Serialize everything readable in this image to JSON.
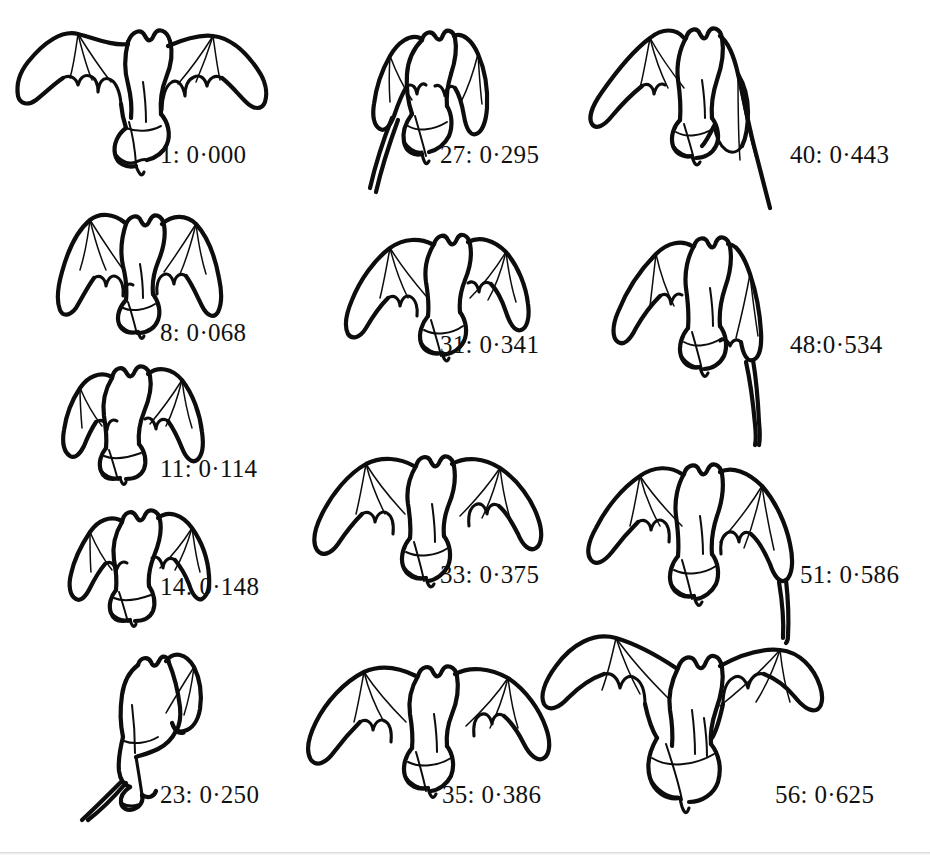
{
  "figure": {
    "kind": "scientific-line-drawing-sequence",
    "background_color": "#ffffff",
    "ink_color": "#0d0d0d",
    "text_color": "#111111",
    "decimal_separator": "·",
    "label_format": "frame: time",
    "columns": 3,
    "frame_count": 13
  },
  "columns": [
    {
      "name": "column-left",
      "frames": [
        {
          "id": "frame-1",
          "label": "1: 0·000",
          "frame_number": "1",
          "time_value": "0·000"
        },
        {
          "id": "frame-8",
          "label": "8: 0·068",
          "frame_number": "8",
          "time_value": "0·068"
        },
        {
          "id": "frame-11",
          "label": "11: 0·114",
          "frame_number": "11",
          "time_value": "0·114"
        },
        {
          "id": "frame-14",
          "label": "14: 0·148",
          "frame_number": "14",
          "time_value": "0·148"
        },
        {
          "id": "frame-23",
          "label": "23: 0·250",
          "frame_number": "23",
          "time_value": "0·250"
        }
      ]
    },
    {
      "name": "column-middle",
      "frames": [
        {
          "id": "frame-27",
          "label": "27: 0·295",
          "frame_number": "27",
          "time_value": "0·295"
        },
        {
          "id": "frame-31",
          "label": "31: 0·341",
          "frame_number": "31",
          "time_value": "0·341"
        },
        {
          "id": "frame-33",
          "label": "33: 0·375",
          "frame_number": "33",
          "time_value": "0·375"
        },
        {
          "id": "frame-35",
          "label": "35: 0·386",
          "frame_number": "35",
          "time_value": "0·386"
        }
      ]
    },
    {
      "name": "column-right",
      "frames": [
        {
          "id": "frame-40",
          "label": "40: 0·443",
          "frame_number": "40",
          "time_value": "0·443"
        },
        {
          "id": "frame-48",
          "label": "48:0·534",
          "frame_number": "48",
          "time_value": "0·534"
        },
        {
          "id": "frame-51",
          "label": "51: 0·586",
          "frame_number": "51",
          "time_value": "0·586"
        },
        {
          "id": "frame-56",
          "label": "56: 0·625",
          "frame_number": "56",
          "time_value": "0·625"
        }
      ]
    }
  ]
}
